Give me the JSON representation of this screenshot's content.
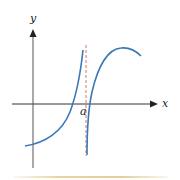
{
  "diagram": {
    "type": "function-graph-vertical-asymptote",
    "axes": {
      "x_label": "x",
      "y_label": "y"
    },
    "asymptote": {
      "label": "a",
      "style": "dashed",
      "color": "#d9756a"
    },
    "curve_color": "#3a78b8",
    "axis_color": "#333333",
    "bottom_rule_color": "#e4d19c"
  }
}
